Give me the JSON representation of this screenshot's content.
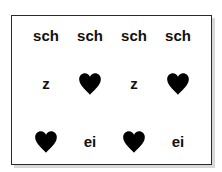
{
  "grid": {
    "rows": [
      [
        {
          "type": "text",
          "value": "sch"
        },
        {
          "type": "text",
          "value": "sch"
        },
        {
          "type": "text",
          "value": "sch"
        },
        {
          "type": "text",
          "value": "sch"
        }
      ],
      [
        {
          "type": "text",
          "value": "z"
        },
        {
          "type": "icon",
          "value": "heart-icon"
        },
        {
          "type": "text",
          "value": "z"
        },
        {
          "type": "icon",
          "value": "heart-icon"
        }
      ],
      [
        {
          "type": "icon",
          "value": "heart-icon"
        },
        {
          "type": "text",
          "value": "ei"
        },
        {
          "type": "icon",
          "value": "heart-icon"
        },
        {
          "type": "text",
          "value": "ei"
        }
      ]
    ]
  },
  "colors": {
    "text": "#111111",
    "heart": "#000000",
    "border": "#2a2a2a",
    "shadow": "#d8d8d8"
  }
}
